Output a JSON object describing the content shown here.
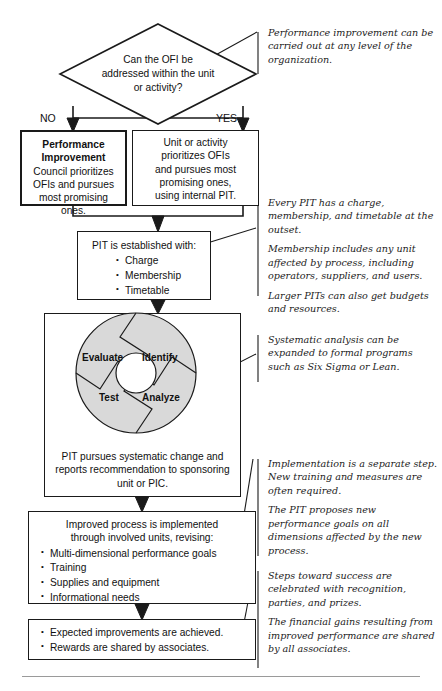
{
  "diagram": {
    "decision": {
      "name": "ofi-decision",
      "lines": [
        "Can the OFI be",
        "addressed within the unit",
        "or activity?"
      ],
      "branch_no": "NO",
      "branch_yes": "YES"
    },
    "boxes": {
      "no_branch": {
        "heading_lines": [
          "Performance",
          "Improvement"
        ],
        "body_lines": [
          "Council prioritizes",
          "OFIs and pursues",
          "most promising ones."
        ]
      },
      "yes_branch": {
        "body_lines": [
          "Unit or activity",
          "prioritizes OFIs",
          "and pursues most",
          "promising ones,",
          "using internal PIT."
        ]
      },
      "pit_established": {
        "heading": "PIT is established with:",
        "bullets": [
          "Charge",
          "Membership",
          "Timetable"
        ]
      },
      "pit_pursues": {
        "body_lines": [
          "PIT pursues systematic change and",
          "reports recommendation to sponsoring",
          "unit or PIC."
        ]
      },
      "improved_process": {
        "heading_lines": [
          "Improved process is implemented",
          "through involved units, revising:"
        ],
        "bullets": [
          "Multi-dimensional performance goals",
          "Training",
          "Supplies and equipment",
          "Informational needs"
        ]
      },
      "results": {
        "bullets": [
          "Expected improvements are achieved.",
          "Rewards are shared by associates."
        ]
      }
    },
    "wheel": {
      "name": "improvement-cycle-wheel",
      "segments": [
        "Identify",
        "Analyze",
        "Test",
        "Evaluate"
      ],
      "fill_color": "#d9d9d9",
      "stroke_color": "#1a1a1a"
    },
    "annotations": [
      {
        "id": "annotation-performance-level",
        "paragraphs": [
          "Performance improvement can be carried out at any level of the organization."
        ]
      },
      {
        "id": "annotation-pit-charter",
        "paragraphs": [
          "Every PIT has a charge, membership, and timetable at the outset.",
          "Membership includes any unit affected by process, including operators, suppliers, and users.",
          "Larger PITs can also get budgets and resources."
        ]
      },
      {
        "id": "annotation-systematic-analysis",
        "paragraphs": [
          "Systematic analysis can be expanded to formal programs such as Six Sigma or Lean."
        ]
      },
      {
        "id": "annotation-implementation",
        "paragraphs": [
          "Implementation is a separate step. New training and measures are often required.",
          "The PIT proposes new performance goals on all dimensions affected by the new process."
        ]
      },
      {
        "id": "annotation-rewards",
        "paragraphs": [
          "Steps toward success are celebrated with recognition, parties, and prizes.",
          "The financial gains resulting from improved performance are shared by all associates."
        ]
      }
    ],
    "colors": {
      "stroke": "#1a1a1a",
      "wheel_fill": "#d9d9d9",
      "background": "#ffffff",
      "rule": "#9a9a9a"
    }
  }
}
